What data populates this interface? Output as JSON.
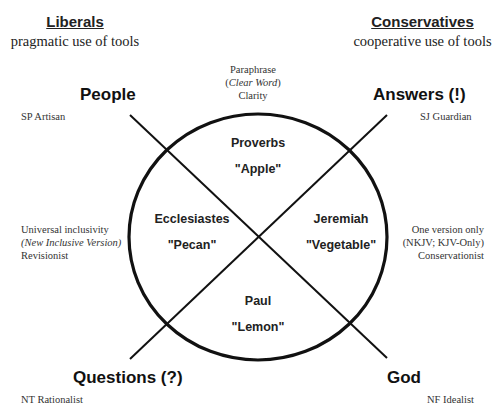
{
  "left_header": {
    "title": "Liberals",
    "subtitle": "pragmatic use of tools"
  },
  "right_header": {
    "title": "Conservatives",
    "subtitle": "cooperative use of tools"
  },
  "top_center": {
    "line1": "Paraphrase",
    "line2_open": "(",
    "line2_italic": "Clear Word",
    "line2_close": ")",
    "line3": "Clarity"
  },
  "corners": {
    "top_left": {
      "label": "People",
      "note": "SP Artisan"
    },
    "top_right": {
      "label": "Answers (!)",
      "note": "SJ Guardian"
    },
    "bottom_left": {
      "label": "Questions (?)",
      "note": "NT Rationalist"
    },
    "bottom_right": {
      "label": "God",
      "note": "NF Idealist"
    }
  },
  "left_middle": {
    "line1": "Universal inclusivity",
    "line2_italic": "(New Inclusive Version)",
    "line3": "Revisionist"
  },
  "right_middle": {
    "line1": "One version only",
    "line2": "(NKJV; KJV-Only)",
    "line3": "Conservationist"
  },
  "quadrants": {
    "top": {
      "book": "Proverbs",
      "fruit": "\"Apple\""
    },
    "left": {
      "book": "Ecclesiastes",
      "fruit": "\"Pecan\""
    },
    "right": {
      "book": "Jeremiah",
      "fruit": "\"Vegetable\""
    },
    "bottom": {
      "book": "Paul",
      "fruit": "\"Lemon\""
    }
  },
  "colors": {
    "ink": "#111111",
    "background": "#ffffff"
  }
}
